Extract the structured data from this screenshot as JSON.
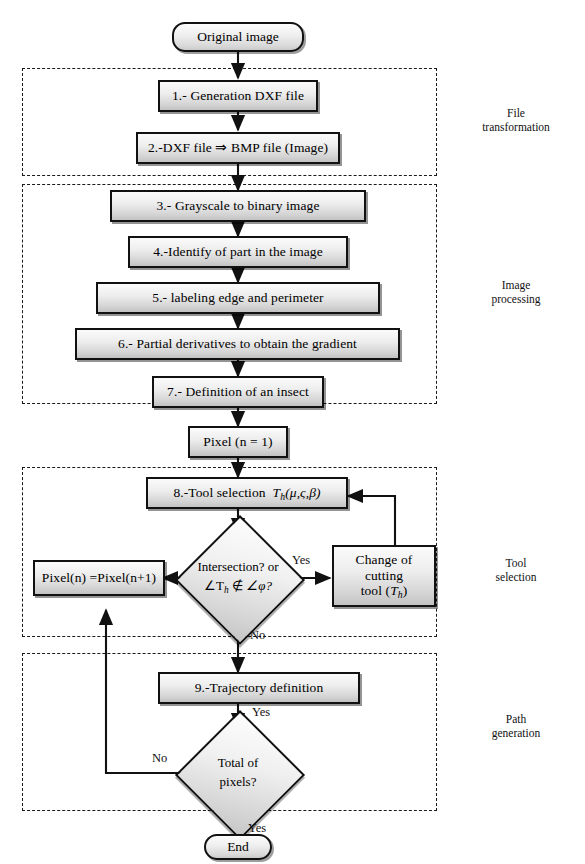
{
  "diagram": {
    "type": "flowchart",
    "start_label": "Original image",
    "end_label": "End",
    "nodes": [
      {
        "id": "start",
        "kind": "terminator",
        "label": "Original image"
      },
      {
        "id": "s1",
        "kind": "process",
        "label": "1.- Generation DXF file"
      },
      {
        "id": "s2",
        "kind": "process",
        "label": "2.-DXF file ⇒  BMP file (Image)"
      },
      {
        "id": "s3",
        "kind": "process",
        "label": "3.- Grayscale to binary image"
      },
      {
        "id": "s4",
        "kind": "process",
        "label": "4.-Identify of part in the image"
      },
      {
        "id": "s5",
        "kind": "process",
        "label": "5.- labeling edge and perimeter"
      },
      {
        "id": "s6",
        "kind": "process",
        "label": "6.- Partial derivatives to obtain the gradient"
      },
      {
        "id": "s7",
        "kind": "process",
        "label": "7.- Definition of an insect"
      },
      {
        "id": "pixel",
        "kind": "process",
        "label": "Pixel (n = 1)"
      },
      {
        "id": "s8",
        "kind": "process",
        "label": "8.-Tool selection  Tₕ(μ,ς,β)"
      },
      {
        "id": "dec1",
        "kind": "decision",
        "label": "Intersection? or ∠Tₕ ∉ ∠φ?"
      },
      {
        "id": "pinc",
        "kind": "process",
        "label": "Pixel(n) =Pixel(n+1)"
      },
      {
        "id": "chg",
        "kind": "process",
        "label": "Change of cutting tool (Tₕ)"
      },
      {
        "id": "s9",
        "kind": "process",
        "label": "9.-Trajectory definition"
      },
      {
        "id": "dec2",
        "kind": "decision",
        "label": "Total of pixels?"
      },
      {
        "id": "end",
        "kind": "terminator",
        "label": "End"
      }
    ],
    "edge_labels": {
      "dec1_yes": "Yes",
      "dec1_no": "No",
      "s9_yes": "Yes",
      "dec2_no": "No",
      "dec2_yes": "Yes"
    },
    "groups": [
      {
        "id": "g1",
        "label_line1": "File",
        "label_line2": "transformation"
      },
      {
        "id": "g2",
        "label_line1": "Image",
        "label_line2": "processing"
      },
      {
        "id": "g3",
        "label_line1": "Tool",
        "label_line2": "selection"
      },
      {
        "id": "g4",
        "label_line1": "Path",
        "label_line2": "generation"
      }
    ],
    "node_text": {
      "s2_prefix": "2.-DXF file",
      "s2_arrow": "⇒",
      "s2_suffix": "BMP file (Image)",
      "s8_prefix": "8.-Tool selection",
      "s8_T": "T",
      "s8_sub": "h",
      "s8_args": "(μ,ς,β)",
      "dec1_line1": "Intersection? or",
      "dec1_angle1": "∠T",
      "dec1_sub1": "h",
      "dec1_notin": "∉",
      "dec1_angle2": "∠φ?",
      "chg_line1": "Change of cutting",
      "chg_line2": "tool",
      "chg_T": "T",
      "chg_sub": "h",
      "dec2_line1": "Total of",
      "dec2_line2": "pixels?"
    },
    "colors": {
      "stroke": "#111111",
      "fill_light": "#fbfbfb",
      "fill_dark": "#c3c3c3",
      "background": "#ffffff"
    }
  }
}
